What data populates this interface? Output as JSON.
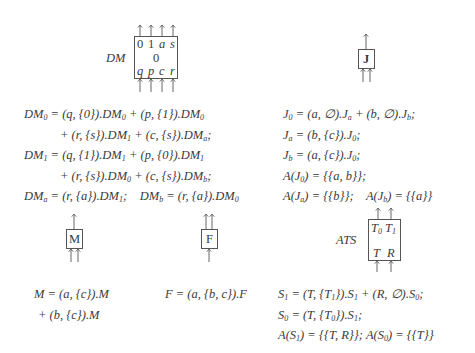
{
  "components": {
    "dm": {
      "name": "DM",
      "ports_top": [
        "0",
        "1",
        "a",
        "s"
      ],
      "state": "0",
      "ports_bottom": [
        "q",
        "p",
        "c",
        "r"
      ]
    },
    "j": {
      "name": "J"
    },
    "m": {
      "name": "M"
    },
    "f": {
      "name": "F"
    },
    "ats": {
      "name": "ATS",
      "ports_top": [
        "T0",
        "T1"
      ],
      "ports_bottom": [
        "T",
        "R"
      ]
    }
  },
  "equations": {
    "dm": [
      "DM₀ = (q, {0}).DM₀ + (p, {1}).DM₀",
      "+ (r, {s}).DM₁ + (c, {s}).DMₐ;",
      "DM₁ = (q, {1}).DM₁ + (p, {0}).DM₁",
      "+ (r, {s}).DM₀ + (c, {s}).DM_b;",
      "DMₐ = (r, {a}).DM₁;    DM_b = (r, {a}).DM₀"
    ],
    "j": [
      "J₀ = (a, ∅).Jₐ + (b, ∅).J_b;",
      "Jₐ = (b, {c}).J₀;",
      "J_b = (a, {c}).J₀;",
      "A(J₀) = {{a, b}};",
      "A(Jₐ) = {{b}};    A(J_b) = {{a}}"
    ],
    "m": [
      "M = (a, {c}).M",
      "+ (b, {c}).M"
    ],
    "f": [
      "F = (a, {b, c}).F"
    ],
    "ats": [
      "S₁ = (T, {T₁}).S₁ + (R, ∅).S₀;",
      "S₀ = (T, {T₀}).S₁;",
      "A(S₁) = {{T, R}}; A(S₀) = {{T}}"
    ]
  }
}
